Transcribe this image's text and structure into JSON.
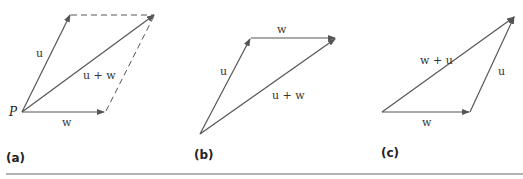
{
  "figure": {
    "panels": [
      {
        "id": "a",
        "caption": "(a)",
        "point_label": "P",
        "labels": {
          "u": "u",
          "w": "w",
          "sum": "u + w"
        }
      },
      {
        "id": "b",
        "caption": "(b)",
        "labels": {
          "u": "u",
          "w": "w",
          "sum": "u + w"
        }
      },
      {
        "id": "c",
        "caption": "(c)",
        "labels": {
          "u": "u",
          "w": "w",
          "sum": "w + u"
        }
      }
    ],
    "colors": {
      "vector": "#555555",
      "dashed": "#555555",
      "rule": "#666666"
    }
  }
}
